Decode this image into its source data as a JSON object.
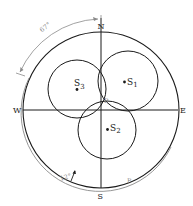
{
  "diagram": {
    "title": "",
    "compass": {
      "north": "N",
      "south": "S",
      "east": "E",
      "west": "W"
    },
    "points": {
      "p_center": "P",
      "p_arc": "P"
    },
    "circles": [
      {
        "id": "s1",
        "label": "S",
        "subscript": "1"
      },
      {
        "id": "s2",
        "label": "S",
        "subscript": "2"
      },
      {
        "id": "s3",
        "label": "S",
        "subscript": "3"
      }
    ],
    "angles": {
      "top_arc": "67°",
      "bottom_arc": "12°"
    },
    "colors": {
      "line": "#1a1a1a",
      "secondary_line": "#8a8a8a",
      "background": "#ffffff"
    }
  }
}
